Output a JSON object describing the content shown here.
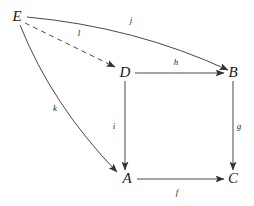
{
  "diagram": {
    "kind": "commutative-diagram",
    "background_color": "#ffffff",
    "stroke_color": "#333333",
    "label_color": "#1a1a1a",
    "nodes": [
      {
        "id": "E",
        "label": "E",
        "x": 17,
        "y": 16
      },
      {
        "id": "D",
        "label": "D",
        "x": 125,
        "y": 72
      },
      {
        "id": "B",
        "label": "B",
        "x": 233,
        "y": 72
      },
      {
        "id": "A",
        "label": "A",
        "x": 127,
        "y": 178
      },
      {
        "id": "C",
        "label": "C",
        "x": 233,
        "y": 178
      }
    ],
    "edges": [
      {
        "id": "j",
        "label": "j",
        "from": "E",
        "to": "B",
        "style": "solid",
        "shape": "curved",
        "label_x": 131,
        "label_y": 20
      },
      {
        "id": "l",
        "label": "l",
        "from": "E",
        "to": "D",
        "style": "dashed",
        "shape": "straight",
        "label_x": 79,
        "label_y": 33
      },
      {
        "id": "k",
        "label": "k",
        "from": "E",
        "to": "A",
        "style": "solid",
        "shape": "curved",
        "label_x": 55,
        "label_y": 108
      },
      {
        "id": "h",
        "label": "h",
        "from": "D",
        "to": "B",
        "style": "solid",
        "shape": "straight",
        "label_x": 176,
        "label_y": 62
      },
      {
        "id": "i",
        "label": "i",
        "from": "D",
        "to": "A",
        "style": "solid",
        "shape": "straight",
        "label_x": 114,
        "label_y": 126
      },
      {
        "id": "g",
        "label": "g",
        "from": "B",
        "to": "C",
        "style": "solid",
        "shape": "straight",
        "label_x": 239,
        "label_y": 126
      },
      {
        "id": "f",
        "label": "f",
        "from": "A",
        "to": "C",
        "style": "solid",
        "shape": "straight",
        "label_x": 177,
        "label_y": 192
      }
    ]
  }
}
